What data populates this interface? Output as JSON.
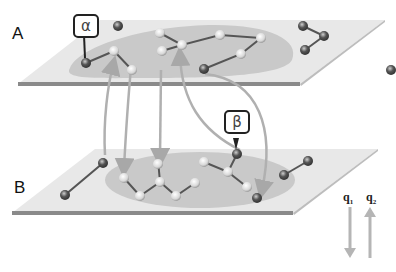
{
  "planes": [
    {
      "id": "A",
      "label": "A"
    },
    {
      "id": "B",
      "label": "B"
    }
  ],
  "callouts": [
    {
      "id": "alpha",
      "symbol": "α",
      "plane": "A"
    },
    {
      "id": "beta",
      "symbol": "β",
      "plane": "B"
    }
  ],
  "legend": {
    "q1": {
      "text": "q",
      "sub": "1",
      "direction": "down"
    },
    "q2": {
      "text": "q",
      "sub": "2",
      "direction": "up"
    }
  },
  "colors": {
    "plane_fill": "#e6e6e6",
    "plane_edge": "#8a8a8a",
    "cluster_fill": "#c8c8c8",
    "bond": "#555555",
    "arrow": "#b0b0b0",
    "atom_dark": "#555555",
    "atom_light": "#f2f2f2"
  }
}
